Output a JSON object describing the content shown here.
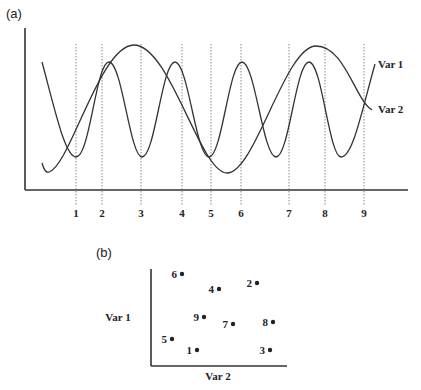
{
  "panel_a": {
    "label": "(a)",
    "series": [
      {
        "name": "Var 1",
        "label": "Var 1",
        "description": "fast oscillation"
      },
      {
        "name": "Var 2",
        "label": "Var 2",
        "description": "slow oscillation"
      }
    ],
    "time_markers": [
      "1",
      "2",
      "3",
      "4",
      "5",
      "6",
      "7",
      "8",
      "9"
    ]
  },
  "panel_b": {
    "label": "(b)",
    "y_axis_label": "Var 1",
    "x_axis_label": "Var 2",
    "points": [
      {
        "label": "1",
        "x": 197,
        "y": 350
      },
      {
        "label": "2",
        "x": 257,
        "y": 283
      },
      {
        "label": "3",
        "x": 270,
        "y": 350
      },
      {
        "label": "4",
        "x": 219,
        "y": 289
      },
      {
        "label": "5",
        "x": 172,
        "y": 339
      },
      {
        "label": "6",
        "x": 182,
        "y": 274
      },
      {
        "label": "7",
        "x": 233,
        "y": 324
      },
      {
        "label": "8",
        "x": 273,
        "y": 322
      },
      {
        "label": "9",
        "x": 203,
        "y": 317
      }
    ]
  }
}
